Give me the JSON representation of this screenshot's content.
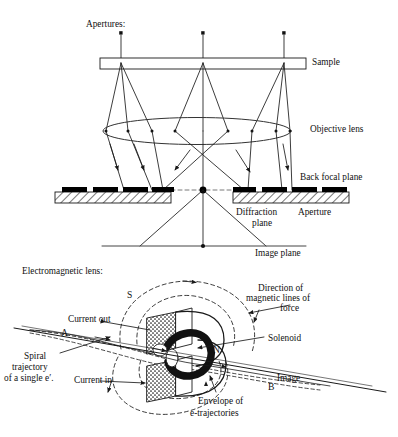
{
  "figure": {
    "title_visible": false,
    "background_color": "#ffffff",
    "line_color": "#1a1a1a",
    "aperture_fill": "#000000",
    "hatch_color": "#1a1a1a",
    "panels": [
      {
        "name": "ray-diagram",
        "heading": "Apertures:"
      },
      {
        "name": "electromagnetic-lens",
        "heading": "Electromagnetic lens:"
      }
    ]
  },
  "ray_diagram": {
    "heading": "Apertures:",
    "labels": {
      "sample": "Sample",
      "objective_lens": "Objective lens",
      "back_focal_plane": "Back focal plane",
      "diffraction": "Diffraction",
      "aperture": "Aperture",
      "plane": "plane",
      "image_plane": "Image plane"
    },
    "source_points_x": [
      121,
      203,
      284
    ],
    "source_point_y": 33,
    "sample_bar": {
      "x": 100,
      "y": 58,
      "width": 206,
      "height": 11
    },
    "objective_lens_ellipse": {
      "cx": 197,
      "cy": 131,
      "rx": 94,
      "ry": 14
    },
    "back_focal_plane_y": 190,
    "bfp_left_bar": {
      "x": 55,
      "y": 192,
      "width": 116,
      "height": 11
    },
    "bfp_right_bar": {
      "x": 233,
      "y": 192,
      "width": 116,
      "height": 11
    },
    "bfp_aperture_blocks_left_x": [
      62,
      92,
      122,
      150
    ],
    "bfp_aperture_blocks_right_x": [
      240,
      270,
      300,
      328
    ],
    "bfp_center_spot": {
      "cx": 203,
      "cy": 190
    },
    "image_plane": {
      "x1": 102,
      "x2": 306,
      "y": 246
    },
    "image_plane_spot_x": 203,
    "lens_dots_x": [
      106,
      128,
      152,
      175,
      228,
      252,
      276,
      290
    ],
    "optical_axis_x": 203
  },
  "em_lens": {
    "heading": "Electromagnetic lens:",
    "labels": {
      "pole_s": "S",
      "pole_n": "N",
      "point_a": "A",
      "point_b": "B",
      "current_out": "Current out",
      "current_in": "Current in",
      "solenoid": "Solenoid",
      "image": "Image",
      "direction_line1": "Direction of",
      "direction_line2": "magnetic lines of",
      "direction_line3": "force",
      "spiral_line1": "Spiral",
      "spiral_line2": "trajectory",
      "spiral_line3": "of a single e′.",
      "envelope_line1": "Envelope of",
      "envelope_line2": "e-trajectories"
    },
    "axis": {
      "x1": 14,
      "y1": 328,
      "x2": 386,
      "y2": 388
    },
    "core_color": "#1a1a1a",
    "coil_fill_pattern": "stipple"
  }
}
